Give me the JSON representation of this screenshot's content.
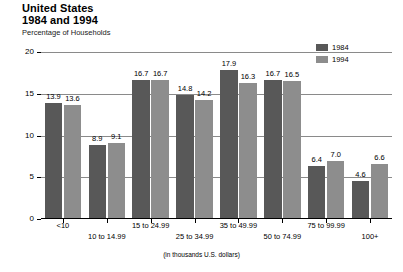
{
  "header": {
    "title_line_1": "United States",
    "title_line_2": "1984 and 1994",
    "subtitle": "Percentage of Households"
  },
  "legend": {
    "position": "top-right",
    "items": [
      {
        "label": "1984",
        "color": "#585858"
      },
      {
        "label": "1994",
        "color": "#8d8d8d"
      }
    ]
  },
  "axis": {
    "caption": "(in thousands U.S. dollars)",
    "y_ticks": [
      "0",
      "5",
      "10",
      "15",
      "20"
    ]
  },
  "chart_data": {
    "type": "bar",
    "title": "United States 1984 and 1994",
    "subtitle": "Percentage of Households",
    "xlabel": "(in thousands U.S. dollars)",
    "ylabel": "Percentage of Households",
    "ylim": [
      0,
      20
    ],
    "yticks": [
      0,
      5,
      10,
      15,
      20
    ],
    "grid": true,
    "legend_position": "top-right",
    "categories": [
      "<10",
      "10 to 14.99",
      "15 to 24.99",
      "25 to 34.99",
      "35 to 49.99",
      "50 to 74.99",
      "75 to 99.99",
      "100+"
    ],
    "series": [
      {
        "name": "1984",
        "color": "#585858",
        "values": [
          13.9,
          8.9,
          16.7,
          14.8,
          17.9,
          16.7,
          6.4,
          4.6
        ]
      },
      {
        "name": "1994",
        "color": "#8d8d8d",
        "values": [
          13.6,
          9.1,
          16.7,
          14.2,
          16.3,
          16.5,
          7.0,
          6.6
        ]
      }
    ],
    "value_labels": [
      [
        "13.9",
        "13.6"
      ],
      [
        "8.9",
        "9.1"
      ],
      [
        "16.7",
        "16.7"
      ],
      [
        "14.8",
        "14.2"
      ],
      [
        "17.9",
        "16.3"
      ],
      [
        "16.7",
        "16.5"
      ],
      [
        "6.4",
        "7.0"
      ],
      [
        "4.6",
        "6.6"
      ]
    ]
  }
}
